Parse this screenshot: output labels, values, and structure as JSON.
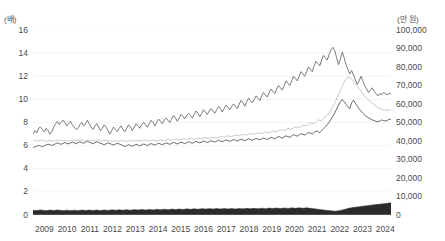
{
  "chart_data": {
    "type": "line",
    "title": "",
    "xlabel": "",
    "ylabel": "",
    "unit_left": "(배)",
    "unit_right": "(만 원)",
    "grid": true,
    "legend_position": "none",
    "x_categories": [
      "2009",
      "2010",
      "2011",
      "2012",
      "2013",
      "2014",
      "2015",
      "2016",
      "2017",
      "2018",
      "2019",
      "2020",
      "2021",
      "2022",
      "2023",
      "2024"
    ],
    "yticks_left": [
      0,
      2,
      4,
      6,
      8,
      10,
      12,
      14,
      16
    ],
    "yticks_right": [
      0,
      10000,
      20000,
      30000,
      40000,
      50000,
      60000,
      70000,
      80000,
      90000,
      100000
    ],
    "ytick_labels_right": [
      "0",
      "10,000",
      "20,000",
      "30,000",
      "40,000",
      "50,000",
      "60,000",
      "70,000",
      "80,000",
      "90,000",
      "100,000"
    ],
    "ylim_left": [
      0,
      16
    ],
    "ylim_right": [
      0,
      100000
    ],
    "x_start": 2009.0,
    "x_end": 2024.75,
    "series": [
      {
        "name": "upper-ratio-line",
        "type": "line",
        "axis": "left",
        "color": "#6b6b6b",
        "width": 0.9,
        "values": [
          7.0,
          7.3,
          7.1,
          7.5,
          7.6,
          7.4,
          7.2,
          7.5,
          7.3,
          7.0,
          7.2,
          7.6,
          7.9,
          8.1,
          7.8,
          8.0,
          8.2,
          8.0,
          7.7,
          7.9,
          8.1,
          7.8,
          7.6,
          7.4,
          7.5,
          7.8,
          8.0,
          7.7,
          7.9,
          8.2,
          7.9,
          7.6,
          7.4,
          7.7,
          7.9,
          7.6,
          7.3,
          7.5,
          7.8,
          7.6,
          7.3,
          7.0,
          7.3,
          7.6,
          7.4,
          7.2,
          7.5,
          7.7,
          7.4,
          7.2,
          7.5,
          7.8,
          7.6,
          7.3,
          7.6,
          7.9,
          7.7,
          7.5,
          7.8,
          8.0,
          7.8,
          7.6,
          7.9,
          8.2,
          8.0,
          7.7,
          8.0,
          8.3,
          8.1,
          7.9,
          8.2,
          8.4,
          8.2,
          8.0,
          8.3,
          8.6,
          8.4,
          8.1,
          8.4,
          8.7,
          8.5,
          8.3,
          8.6,
          8.8,
          8.6,
          8.4,
          8.7,
          9.0,
          8.8,
          8.5,
          8.8,
          9.1,
          8.9,
          8.7,
          9.0,
          9.2,
          9.0,
          8.8,
          9.1,
          9.4,
          9.2,
          8.9,
          9.2,
          9.5,
          9.3,
          9.1,
          9.4,
          9.6,
          9.4,
          9.2,
          9.6,
          9.9,
          9.7,
          9.4,
          9.8,
          10.1,
          9.9,
          9.7,
          10.0,
          10.3,
          10.1,
          9.9,
          10.3,
          10.6,
          10.4,
          10.2,
          10.6,
          10.9,
          10.7,
          10.5,
          10.9,
          11.2,
          11.0,
          10.8,
          11.2,
          11.6,
          11.4,
          11.2,
          11.6,
          12.0,
          11.8,
          11.6,
          12.0,
          12.4,
          12.2,
          12.0,
          12.4,
          12.8,
          12.6,
          12.4,
          12.9,
          13.3,
          13.1,
          12.9,
          13.4,
          13.8,
          13.6,
          13.4,
          13.9,
          14.3,
          14.5,
          14.2,
          13.6,
          13.0,
          13.5,
          14.1,
          13.6,
          13.0,
          12.6,
          12.2,
          12.5,
          12.1,
          11.7,
          11.3,
          11.6,
          12.0,
          11.6,
          11.2,
          10.9,
          10.6,
          10.8,
          11.0,
          10.7,
          10.5,
          10.3,
          10.5,
          10.4,
          10.6,
          10.5,
          10.4,
          10.5,
          10.5
        ]
      },
      {
        "name": "middle-gray-line",
        "type": "line",
        "axis": "right",
        "color": "#c2c2c2",
        "width": 0.9,
        "values": [
          40500,
          40300,
          40000,
          40200,
          40500,
          40300,
          40000,
          39800,
          40000,
          40300,
          40100,
          39900,
          40200,
          40500,
          40300,
          40000,
          40200,
          40400,
          40200,
          40000,
          40300,
          40500,
          40300,
          40100,
          40400,
          40600,
          40400,
          40200,
          40000,
          40300,
          40500,
          40300,
          40100,
          40400,
          40600,
          40400,
          40200,
          40000,
          40200,
          40400,
          40200,
          40000,
          39800,
          40000,
          40200,
          40000,
          39800,
          40000,
          40200,
          40000,
          39800,
          40000,
          40300,
          40100,
          39900,
          40100,
          40300,
          40100,
          39900,
          40200,
          40400,
          40200,
          40000,
          40300,
          40500,
          40300,
          40100,
          40400,
          40600,
          40400,
          40200,
          40500,
          40800,
          40600,
          40400,
          40700,
          41000,
          40800,
          40600,
          40900,
          41200,
          41000,
          40800,
          41100,
          41400,
          41200,
          41000,
          41300,
          41600,
          41400,
          41200,
          41500,
          41800,
          41600,
          41400,
          41700,
          42000,
          41800,
          41600,
          42000,
          42400,
          42200,
          42000,
          42400,
          42800,
          42600,
          42400,
          42800,
          43200,
          43000,
          42800,
          43200,
          43600,
          43400,
          43200,
          43600,
          44000,
          43800,
          43600,
          44000,
          44400,
          44200,
          44000,
          44400,
          44800,
          44600,
          44400,
          44900,
          45400,
          45200,
          45000,
          45500,
          46000,
          45800,
          45600,
          46200,
          46800,
          46600,
          46400,
          47000,
          47600,
          47400,
          47200,
          47900,
          48600,
          48400,
          48200,
          49000,
          49800,
          49600,
          49400,
          50400,
          51400,
          51200,
          51000,
          52200,
          53400,
          53800,
          55000,
          56800,
          58600,
          60400,
          62600,
          65000,
          67400,
          69800,
          71800,
          73400,
          74600,
          74200,
          73400,
          72400,
          71200,
          69800,
          68400,
          67000,
          65600,
          64400,
          63200,
          62200,
          61200,
          60400,
          59600,
          58800,
          58200,
          57600,
          57200,
          56900,
          56700,
          56600,
          56800,
          57000
        ]
      },
      {
        "name": "lower-dark-line",
        "type": "line",
        "axis": "right",
        "color": "#585858",
        "width": 0.9,
        "values": [
          36500,
          36800,
          37200,
          37600,
          37300,
          37000,
          37400,
          37900,
          38300,
          38000,
          37600,
          38000,
          38500,
          39000,
          38600,
          38200,
          38700,
          39200,
          38800,
          38400,
          38900,
          39400,
          39000,
          38600,
          39100,
          39600,
          39200,
          38800,
          39300,
          39800,
          39400,
          39000,
          38600,
          39100,
          39600,
          39200,
          38800,
          38400,
          38000,
          38500,
          39000,
          38600,
          38200,
          37800,
          38300,
          38800,
          38400,
          38000,
          37500,
          37000,
          37500,
          38000,
          37600,
          37200,
          37700,
          38200,
          37800,
          37400,
          37900,
          38400,
          38000,
          37600,
          38100,
          38600,
          38200,
          37800,
          38300,
          38800,
          38400,
          38000,
          38500,
          39000,
          38600,
          38200,
          38700,
          39200,
          38800,
          38400,
          38900,
          39400,
          39000,
          38600,
          39100,
          39600,
          39200,
          38800,
          39300,
          39800,
          39400,
          39000,
          39500,
          40000,
          39600,
          39200,
          39700,
          40200,
          39800,
          39400,
          39900,
          40400,
          40000,
          39600,
          40100,
          40600,
          40200,
          39800,
          40300,
          40800,
          40400,
          40000,
          40500,
          41000,
          40600,
          40200,
          40700,
          41200,
          40800,
          40400,
          40900,
          41400,
          41000,
          40600,
          41100,
          41600,
          41200,
          40800,
          41400,
          42000,
          41600,
          41200,
          41800,
          42400,
          42000,
          41600,
          42200,
          42800,
          42400,
          42000,
          42700,
          43400,
          43000,
          42600,
          43300,
          44000,
          43600,
          43200,
          43900,
          44600,
          44200,
          43800,
          44600,
          45400,
          45000,
          44600,
          45600,
          46600,
          47600,
          48800,
          50200,
          51800,
          53400,
          55200,
          57200,
          59400,
          61200,
          62400,
          61200,
          59800,
          58600,
          57400,
          60800,
          62000,
          60400,
          58800,
          57400,
          56200,
          55000,
          54000,
          53200,
          52600,
          52000,
          51400,
          51000,
          50600,
          50400,
          50800,
          51400,
          51000,
          50800,
          51200,
          51600,
          51800
        ]
      },
      {
        "name": "baseline-dark-area",
        "type": "area",
        "axis": "left",
        "color": "#2b2b2b",
        "values": [
          0.42,
          0.4,
          0.38,
          0.41,
          0.44,
          0.42,
          0.4,
          0.38,
          0.4,
          0.43,
          0.41,
          0.39,
          0.41,
          0.44,
          0.42,
          0.4,
          0.38,
          0.4,
          0.42,
          0.4,
          0.38,
          0.4,
          0.42,
          0.4,
          0.38,
          0.4,
          0.43,
          0.41,
          0.39,
          0.41,
          0.43,
          0.41,
          0.39,
          0.41,
          0.43,
          0.41,
          0.39,
          0.41,
          0.44,
          0.42,
          0.4,
          0.42,
          0.45,
          0.43,
          0.41,
          0.43,
          0.45,
          0.43,
          0.41,
          0.43,
          0.46,
          0.44,
          0.42,
          0.44,
          0.47,
          0.45,
          0.43,
          0.45,
          0.47,
          0.45,
          0.43,
          0.45,
          0.48,
          0.46,
          0.44,
          0.46,
          0.49,
          0.47,
          0.45,
          0.47,
          0.5,
          0.48,
          0.46,
          0.48,
          0.51,
          0.49,
          0.47,
          0.49,
          0.52,
          0.5,
          0.48,
          0.5,
          0.53,
          0.51,
          0.49,
          0.51,
          0.54,
          0.52,
          0.5,
          0.52,
          0.55,
          0.53,
          0.51,
          0.53,
          0.55,
          0.53,
          0.51,
          0.53,
          0.56,
          0.54,
          0.52,
          0.54,
          0.56,
          0.54,
          0.52,
          0.54,
          0.56,
          0.54,
          0.52,
          0.54,
          0.57,
          0.55,
          0.53,
          0.55,
          0.58,
          0.56,
          0.54,
          0.56,
          0.58,
          0.56,
          0.54,
          0.56,
          0.59,
          0.57,
          0.55,
          0.57,
          0.6,
          0.58,
          0.56,
          0.58,
          0.6,
          0.58,
          0.56,
          0.58,
          0.61,
          0.59,
          0.57,
          0.59,
          0.62,
          0.6,
          0.58,
          0.6,
          0.62,
          0.6,
          0.58,
          0.6,
          0.62,
          0.6,
          0.58,
          0.56,
          0.54,
          0.52,
          0.5,
          0.48,
          0.46,
          0.44,
          0.42,
          0.4,
          0.38,
          0.36,
          0.34,
          0.33,
          0.34,
          0.36,
          0.39,
          0.43,
          0.47,
          0.52,
          0.56,
          0.6,
          0.63,
          0.66,
          0.68,
          0.7,
          0.72,
          0.74,
          0.76,
          0.78,
          0.8,
          0.82,
          0.84,
          0.86,
          0.88,
          0.9,
          0.92,
          0.94,
          0.96,
          0.98,
          1.0,
          1.02,
          1.04,
          1.05
        ]
      }
    ]
  }
}
